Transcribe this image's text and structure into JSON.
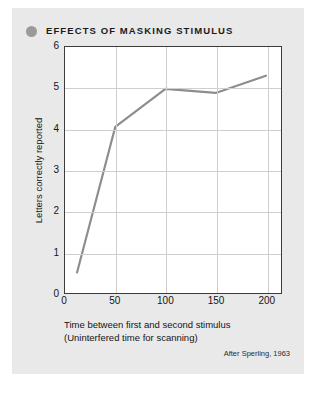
{
  "card": {
    "background_color": "#e9e9e9"
  },
  "header": {
    "bullet_icon": "filled-circle-icon",
    "bullet_color": "#9a9a9a",
    "title": "EFFECTS OF MASKING STIMULUS"
  },
  "axes": {
    "ylabel": "Letters correctly reported",
    "yticks": [
      "0",
      "1",
      "2",
      "3",
      "4",
      "5",
      "6"
    ],
    "xticks": [
      "0",
      "50",
      "100",
      "150",
      "200"
    ],
    "xlabel_line1": "Time between first and second stimulus",
    "xlabel_line2": "(Uninterfered time for scanning)"
  },
  "attribution": "After Sperling, 1963",
  "chart_data": {
    "type": "line",
    "title": "EFFECTS OF MASKING STIMULUS",
    "xlabel": "Time between first and second stimulus (Uninterfered time for scanning)",
    "ylabel": "Letters correctly reported",
    "xlim": [
      0,
      215
    ],
    "ylim": [
      0,
      6
    ],
    "xticks": [
      0,
      50,
      100,
      150,
      200
    ],
    "yticks": [
      0,
      1,
      2,
      3,
      4,
      5,
      6
    ],
    "grid": true,
    "legend": "none",
    "line_color": "#8d8d8d",
    "line_width": 2.2,
    "markers": false,
    "x": [
      12,
      50,
      100,
      150,
      200
    ],
    "values": [
      0.5,
      4.05,
      4.98,
      4.88,
      5.3
    ],
    "series": [
      {
        "name": "Letters correctly reported",
        "x": [
          12,
          50,
          100,
          150,
          200
        ],
        "values": [
          0.5,
          4.05,
          4.98,
          4.88,
          5.3
        ]
      }
    ],
    "annotations": [
      "After Sperling, 1963"
    ]
  }
}
